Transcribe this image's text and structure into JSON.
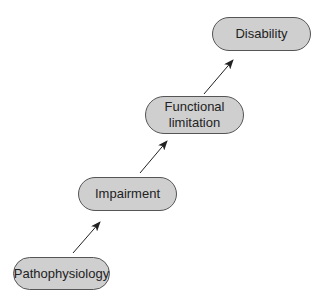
{
  "diagram": {
    "type": "flow",
    "direction": "bottom-left to top-right",
    "nodes": [
      {
        "id": "pathophysiology",
        "label": "Pathophysiology"
      },
      {
        "id": "impairment",
        "label": "Impairment"
      },
      {
        "id": "functional_limitation",
        "label_line1": "Functional",
        "label_line2": "limitation"
      },
      {
        "id": "disability",
        "label": "Disability"
      }
    ],
    "edges": [
      {
        "from": "pathophysiology",
        "to": "impairment"
      },
      {
        "from": "impairment",
        "to": "functional_limitation"
      },
      {
        "from": "functional_limitation",
        "to": "disability"
      }
    ],
    "colors": {
      "node_fill": "#cfcfcf",
      "node_border": "#555555",
      "arrow": "#222222"
    }
  }
}
